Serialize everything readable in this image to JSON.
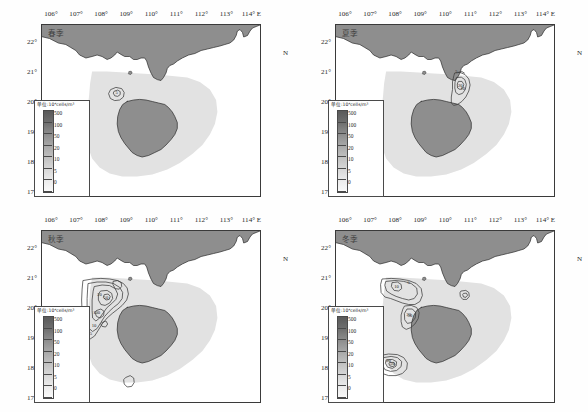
{
  "figure": {
    "type": "map-panel-grid",
    "rows": 2,
    "columns": 2,
    "background": "#ffffff"
  },
  "axes": {
    "longitude_label_suffix": "E",
    "latitude_label_suffix": "N",
    "longitude_ticks": [
      "106°",
      "107°",
      "108°",
      "109°",
      "110°",
      "111°",
      "112°",
      "113°",
      "114°"
    ],
    "longitude_values": [
      106,
      107,
      108,
      109,
      110,
      111,
      112,
      113,
      114
    ],
    "longitude_last_label": "114° E",
    "latitude_ticks": [
      "22°",
      "21°",
      "20°",
      "19°",
      "18°",
      "17°"
    ],
    "latitude_values": [
      22,
      21,
      20,
      19,
      18,
      17
    ],
    "latitude_n_marker": "N",
    "xlim": [
      105.6,
      114.3
    ],
    "ylim": [
      16.9,
      22.6
    ]
  },
  "colorbar": {
    "unit_label": "单位:10⁴cells/m³",
    "ticks": [
      "500",
      "100",
      "50",
      "20",
      "10",
      "5",
      "0"
    ],
    "values": [
      500,
      100,
      50,
      20,
      10,
      5,
      0
    ],
    "orientation": "vertical",
    "colormap": "grayscale",
    "high_color": "#5a5a5a",
    "low_color": "#fafafa"
  },
  "colors": {
    "land": "#8e8e8e",
    "sea_blank": "#ffffff",
    "data_shallow": "#e2e2e2",
    "contour_line": "#3c3c3c",
    "frame": "#3a3a3a",
    "text": "#2b2b2b"
  },
  "panels": [
    {
      "id": "spring",
      "season_label": "春季",
      "position": "top-left",
      "contour_labels": [
        "5"
      ],
      "feature_note": "single small closed contour near 108.6°E, 20.3°N"
    },
    {
      "id": "summer",
      "season_label": "夏季",
      "position": "top-right",
      "contour_labels": [
        "5",
        "10",
        "20"
      ],
      "feature_note": "contours east of Leizhou Peninsula near 110.5°E, 20.5°N"
    },
    {
      "id": "autumn",
      "season_label": "秋季",
      "position": "bottom-left",
      "contour_labels": [
        "5",
        "10",
        "20",
        "50",
        "100"
      ],
      "feature_note": "dense nested contours across Beibu Gulf 107°-109°E, 19°-21°N"
    },
    {
      "id": "winter",
      "season_label": "冬季",
      "position": "bottom-right",
      "contour_labels": [
        "5",
        "10",
        "20",
        "50",
        "100"
      ],
      "feature_note": "contours in northern gulf and southwest of Hainan near 108°E, 18°N"
    }
  ],
  "chart_data": {
    "type": "heatmap",
    "title": "",
    "xlabel": "Longitude (°E)",
    "ylabel": "Latitude (°N)",
    "grid": false,
    "legend_position": "inset-left",
    "xlim": [
      105.6,
      114.3
    ],
    "ylim": [
      16.9,
      22.6
    ],
    "contour_levels": [
      0,
      5,
      10,
      20,
      50,
      100,
      500
    ],
    "unit": "10⁴cells/m³",
    "panels": [
      {
        "name": "春季",
        "contours_present": [
          5
        ],
        "max_level": 5
      },
      {
        "name": "夏季",
        "contours_present": [
          5,
          10,
          20
        ],
        "max_level": 20
      },
      {
        "name": "秋季",
        "contours_present": [
          5,
          10,
          20,
          50,
          100
        ],
        "max_level": 100
      },
      {
        "name": "冬季",
        "contours_present": [
          5,
          10,
          20,
          50,
          100
        ],
        "max_level": 100
      }
    ]
  }
}
